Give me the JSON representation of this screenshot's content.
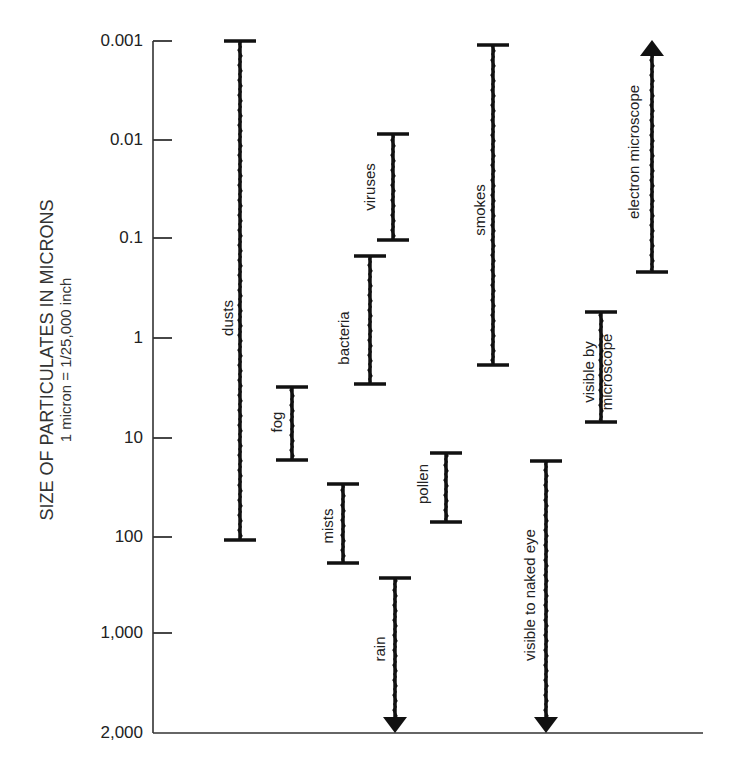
{
  "chart_data": {
    "type": "range",
    "title": "",
    "ylabel": "SIZE OF PARTICULATES IN MICRONS",
    "ylabel_subtitle": "1 micron = 1/25,000 inch",
    "xlabel": "",
    "y_scale": "log (inverted, small at top)",
    "ylim": [
      0.001,
      2000
    ],
    "y_ticks": [
      "0.001",
      "0.01",
      "0.1",
      "1",
      "10",
      "100",
      "1,000",
      "2,000"
    ],
    "grid": false,
    "legend": null,
    "ranges": [
      {
        "name": "dusts",
        "min": 0.001,
        "max": 100,
        "open_end": null
      },
      {
        "name": "fog",
        "min": 3,
        "max": 15,
        "open_end": null
      },
      {
        "name": "mists",
        "min": 30,
        "max": 180,
        "open_end": null
      },
      {
        "name": "bacteria",
        "min": 0.15,
        "max": 3,
        "open_end": null
      },
      {
        "name": "viruses",
        "min": 0.01,
        "max": 0.1,
        "open_end": null
      },
      {
        "name": "rain",
        "min": 250,
        "max": 2000,
        "open_end": "down"
      },
      {
        "name": "pollen",
        "min": 15,
        "max": 70,
        "open_end": null
      },
      {
        "name": "smokes",
        "min": 0.001,
        "max": 0.5,
        "open_end": null
      },
      {
        "name": "visible to naked eye",
        "min": 17,
        "max": 2000,
        "open_end": "down"
      },
      {
        "name": "visible by microscope",
        "min": 0.5,
        "max": 7,
        "open_end": null
      },
      {
        "name": "electron microscope",
        "min": 0.001,
        "max": 0.2,
        "open_end": "up"
      }
    ]
  },
  "axis": {
    "title": "SIZE OF PARTICULATES IN MICRONS",
    "subtitle": "1 micron = 1/25,000 inch",
    "ticks": [
      {
        "label": "0.001",
        "y": 41
      },
      {
        "label": "0.01",
        "y": 140
      },
      {
        "label": "0.1",
        "y": 238
      },
      {
        "label": "1",
        "y": 338
      },
      {
        "label": "10",
        "y": 438
      },
      {
        "label": "100",
        "y": 537
      },
      {
        "label": "1,000",
        "y": 633
      },
      {
        "label": "2,000",
        "y": 733
      }
    ]
  },
  "bars": [
    {
      "label": "dusts",
      "lines": [
        "dusts"
      ],
      "x": 240,
      "y1": 41,
      "y2": 540,
      "top": "cap",
      "bottom": "cap",
      "label_x": 228,
      "label_y": 318
    },
    {
      "label": "fog",
      "lines": [
        "fog"
      ],
      "x": 292,
      "y1": 387,
      "y2": 460,
      "top": "cap",
      "bottom": "cap",
      "label_x": 277,
      "label_y": 422
    },
    {
      "label": "mists",
      "lines": [
        "mists"
      ],
      "x": 343,
      "y1": 484,
      "y2": 563,
      "top": "cap",
      "bottom": "cap",
      "label_x": 328,
      "label_y": 526
    },
    {
      "label": "bacteria",
      "lines": [
        "bacteria"
      ],
      "x": 370,
      "y1": 256,
      "y2": 384,
      "top": "cap",
      "bottom": "cap",
      "label_x": 344,
      "label_y": 338
    },
    {
      "label": "viruses",
      "lines": [
        "viruses"
      ],
      "x": 393,
      "y1": 134,
      "y2": 240,
      "top": "cap",
      "bottom": "cap",
      "label_x": 370,
      "label_y": 187
    },
    {
      "label": "rain",
      "lines": [
        "rain"
      ],
      "x": 395,
      "y1": 578,
      "y2": 733,
      "top": "cap",
      "bottom": "arrow",
      "label_x": 380,
      "label_y": 649
    },
    {
      "label": "pollen",
      "lines": [
        "pollen"
      ],
      "x": 446,
      "y1": 453,
      "y2": 522,
      "top": "cap",
      "bottom": "cap",
      "label_x": 423,
      "label_y": 484
    },
    {
      "label": "smokes",
      "lines": [
        "smokes"
      ],
      "x": 493,
      "y1": 45,
      "y2": 365,
      "top": "cap",
      "bottom": "cap",
      "label_x": 480,
      "label_y": 210
    },
    {
      "label": "visible to naked eye",
      "lines": [
        "visible to naked eye"
      ],
      "x": 546,
      "y1": 461,
      "y2": 733,
      "top": "cap",
      "bottom": "arrow",
      "label_x": 530,
      "label_y": 595
    },
    {
      "label": "visible by microscope",
      "lines": [
        "visible by",
        "microscope"
      ],
      "x": 601,
      "y1": 312,
      "y2": 422,
      "top": "cap",
      "bottom": "cap",
      "label_x": 598,
      "label_y": 372
    },
    {
      "label": "electron microscope",
      "lines": [
        "electron microscope"
      ],
      "x": 652,
      "y1": 40,
      "y2": 272,
      "top": "arrow",
      "bottom": "cap",
      "label_x": 634,
      "label_y": 152
    }
  ],
  "colors": {
    "ink": "#111111",
    "axis": "#333333",
    "background": "#ffffff"
  }
}
